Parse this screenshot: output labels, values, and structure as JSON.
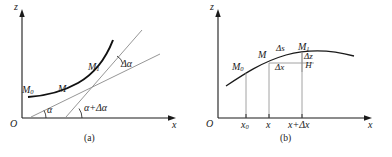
{
  "figure": {
    "background": "#ffffff",
    "stroke_dark": "#1a1a1a",
    "stroke_light": "#8a8a8a"
  },
  "panels": [
    {
      "id": "a",
      "caption": "(a)",
      "axes": {
        "x_label": "x",
        "z_label": "z",
        "origin_label": "O"
      },
      "point_labels": [
        {
          "name": "M0",
          "base": "M",
          "sub": "0"
        },
        {
          "name": "M",
          "base": "M",
          "sub": ""
        },
        {
          "name": "M1",
          "base": "M",
          "sub": "1"
        }
      ],
      "angle_labels": [
        {
          "name": "alpha",
          "text": "α"
        },
        {
          "name": "alpha-plus-delta-alpha",
          "text": "α+Δα"
        },
        {
          "name": "delta-alpha",
          "text": "Δα"
        }
      ]
    },
    {
      "id": "b",
      "caption": "(b)",
      "axes": {
        "x_label": "x",
        "z_label": "z",
        "origin_label": "O"
      },
      "point_labels": [
        {
          "name": "M0",
          "base": "M",
          "sub": "0"
        },
        {
          "name": "M",
          "base": "M",
          "sub": ""
        },
        {
          "name": "M1",
          "base": "M",
          "sub": "1"
        }
      ],
      "increment_labels": [
        {
          "name": "delta-s",
          "text": "Δs"
        },
        {
          "name": "delta-x",
          "text": "Δx"
        }
      ],
      "fraction_label": {
        "numerator": "Δz",
        "denominator": "H"
      },
      "x_ticks": [
        {
          "name": "x0",
          "base": "x",
          "sub": "0",
          "text": "x₀"
        },
        {
          "name": "x",
          "base": "x",
          "sub": "",
          "text": "x"
        },
        {
          "name": "x-plus-delta-x",
          "base": "",
          "sub": "",
          "text": "x+Δx"
        }
      ]
    }
  ]
}
